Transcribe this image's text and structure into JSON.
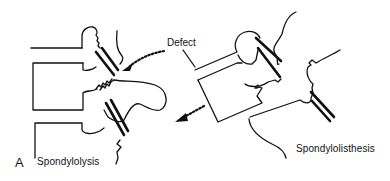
{
  "figure": {
    "panel_letter": "A",
    "labels": {
      "left_condition": "Spondylolysis",
      "right_condition": "Spondylolisthesis",
      "defect": "Defect"
    },
    "colors": {
      "line": "#111111",
      "background": "#ffffff"
    },
    "elements": {
      "left_diagram": "vertebral column with pars interarticularis defect (no slippage)",
      "right_diagram": "vertebral column with forward slippage of vertebral body",
      "arrows": [
        "dotted arrow pointing to defect on left diagram",
        "dotted arrow indicating forward displacement on right diagram"
      ]
    }
  }
}
